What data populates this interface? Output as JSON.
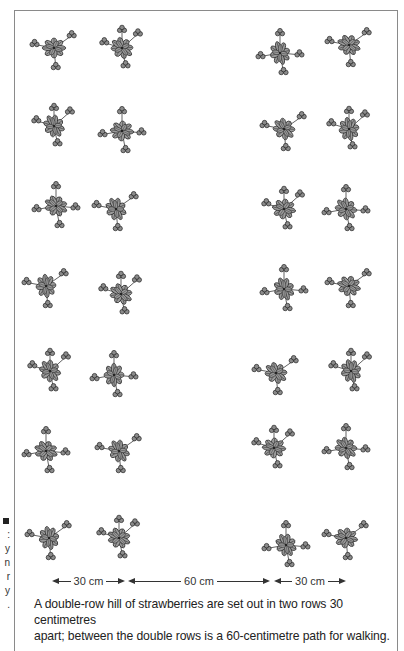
{
  "figure": {
    "left_margin_fragments": [
      ":",
      "y",
      "n",
      "r",
      "y",
      "."
    ],
    "plants": [
      {
        "x": 30,
        "y": 25,
        "variant": 1
      },
      {
        "x": 98,
        "y": 25,
        "variant": 2
      },
      {
        "x": 256,
        "y": 30,
        "variant": 3
      },
      {
        "x": 325,
        "y": 22,
        "variant": 1
      },
      {
        "x": 30,
        "y": 103,
        "variant": 2
      },
      {
        "x": 98,
        "y": 108,
        "variant": 3
      },
      {
        "x": 260,
        "y": 106,
        "variant": 1
      },
      {
        "x": 325,
        "y": 106,
        "variant": 2
      },
      {
        "x": 32,
        "y": 183,
        "variant": 3
      },
      {
        "x": 92,
        "y": 186,
        "variant": 1
      },
      {
        "x": 260,
        "y": 186,
        "variant": 2
      },
      {
        "x": 322,
        "y": 186,
        "variant": 3
      },
      {
        "x": 22,
        "y": 263,
        "variant": 1
      },
      {
        "x": 97,
        "y": 271,
        "variant": 2
      },
      {
        "x": 260,
        "y": 266,
        "variant": 3
      },
      {
        "x": 325,
        "y": 263,
        "variant": 1
      },
      {
        "x": 26,
        "y": 348,
        "variant": 2
      },
      {
        "x": 90,
        "y": 352,
        "variant": 3
      },
      {
        "x": 252,
        "y": 350,
        "variant": 1
      },
      {
        "x": 327,
        "y": 348,
        "variant": 2
      },
      {
        "x": 22,
        "y": 428,
        "variant": 3
      },
      {
        "x": 95,
        "y": 428,
        "variant": 1
      },
      {
        "x": 250,
        "y": 425,
        "variant": 2
      },
      {
        "x": 322,
        "y": 425,
        "variant": 3
      },
      {
        "x": 25,
        "y": 515,
        "variant": 1
      },
      {
        "x": 95,
        "y": 515,
        "variant": 2
      },
      {
        "x": 262,
        "y": 522,
        "variant": 3
      },
      {
        "x": 322,
        "y": 515,
        "variant": 1
      }
    ],
    "measurements": [
      {
        "label": "30 cm",
        "x1": 52,
        "x2": 125
      },
      {
        "label": "60 cm",
        "x1": 128,
        "x2": 270
      },
      {
        "label": "30 cm",
        "x1": 274,
        "x2": 346
      }
    ],
    "caption_line1": "A double-row hill of strawberries are set out in two rows 30 centimetres",
    "caption_line2": "apart; between the double rows is a 60-centimetre path for walking."
  }
}
